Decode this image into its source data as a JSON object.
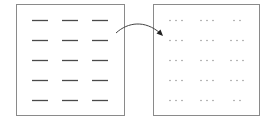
{
  "diagram": {
    "colors": {
      "box_border": "#8a8a8a",
      "dash": "#4a4a4a",
      "dot": "#9a9a9a",
      "arrow": "#333333",
      "background": "#ffffff"
    },
    "left_box": {
      "label": "",
      "rows": 5,
      "cols": 3,
      "element": "dash"
    },
    "right_box": {
      "label": "",
      "rows": 5,
      "cols": 3,
      "element": "dots",
      "dots_per_group": [
        [
          3,
          3,
          2
        ],
        [
          3,
          3,
          3
        ],
        [
          3,
          3,
          3
        ],
        [
          3,
          3,
          3
        ],
        [
          3,
          3,
          2
        ]
      ]
    },
    "arrow": {
      "from": "left_box",
      "to": "right_box",
      "style": "curved"
    }
  }
}
